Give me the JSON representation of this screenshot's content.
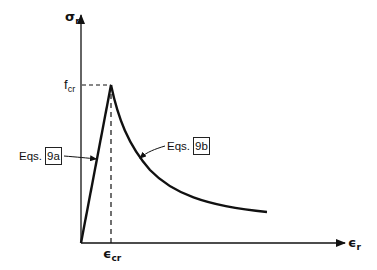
{
  "diagram": {
    "y_axis": {
      "symbol": "σ",
      "subscript": "r"
    },
    "x_axis": {
      "symbol": "ϵ",
      "subscript": "r"
    },
    "peak_stress": {
      "symbol": "f",
      "subscript": "cr"
    },
    "peak_strain": {
      "symbol": "ϵ",
      "subscript": "cr"
    },
    "rising_branch": {
      "prefix": "Eqs.",
      "ref": "9a"
    },
    "descending_branch": {
      "prefix": "Eqs.",
      "ref": "9b"
    },
    "colors": {
      "line": "#111111",
      "background": "#ffffff"
    }
  }
}
